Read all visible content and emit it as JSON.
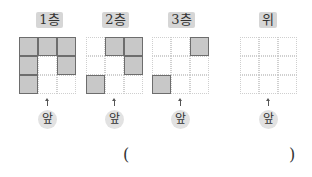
{
  "panels": [
    {
      "label": "1층",
      "cells": [
        1,
        1,
        1,
        1,
        0,
        1,
        1,
        0,
        0
      ],
      "front_label": "앞"
    },
    {
      "label": "2층",
      "cells": [
        0,
        1,
        1,
        0,
        0,
        1,
        1,
        0,
        0
      ],
      "front_label": "앞"
    },
    {
      "label": "3층",
      "cells": [
        0,
        0,
        1,
        0,
        0,
        0,
        1,
        0,
        0
      ],
      "front_label": "앞"
    },
    {
      "label": "위",
      "cells": [
        0,
        0,
        0,
        0,
        0,
        0,
        0,
        0,
        0
      ],
      "front_label": "앞"
    }
  ],
  "answer": {
    "open_paren": "(",
    "close_paren": ")",
    "value": ""
  },
  "colors": {
    "filled": "#c8c8c8",
    "filled_border": "#6d6d6d",
    "label_bg": "#d6d6d6",
    "dotted": "#cfcfcf"
  }
}
